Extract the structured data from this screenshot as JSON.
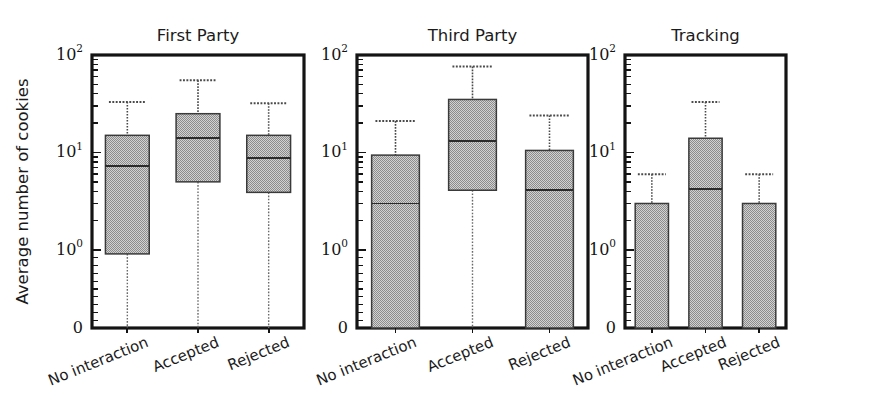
{
  "figure": {
    "ylabel": "Average number of cookies",
    "ytick_labels": [
      "10",
      "10",
      "10",
      "0"
    ],
    "ytick_exponents": [
      "2",
      "1",
      "0",
      ""
    ],
    "categories": [
      "No interaction",
      "Accepted",
      "Rejected"
    ]
  },
  "chart_data": {
    "type": "box",
    "title": "",
    "subtitle": "",
    "xlabel": "",
    "ylabel": "Average number of cookies",
    "yscale": "symlog",
    "ylim": [
      0,
      100
    ],
    "ytick_values": [
      100,
      10,
      1,
      0
    ],
    "ytick_text": [
      "10^2",
      "10^1",
      "10^0",
      "0"
    ],
    "grid": false,
    "legend": null,
    "categories": [
      "No interaction",
      "Accepted",
      "Rejected"
    ],
    "panels": [
      {
        "title": "First Party",
        "boxes": [
          {
            "category": "No interaction",
            "whisker_high": 33.0,
            "q3": 15.0,
            "median": 7.2,
            "q1": 0.95,
            "whisker_low": 0.0
          },
          {
            "category": "Accepted",
            "whisker_high": 55.0,
            "q3": 25.0,
            "median": 14.0,
            "q1": 5.0,
            "whisker_low": 0.0
          },
          {
            "category": "Rejected",
            "whisker_high": 32.0,
            "q3": 15.0,
            "median": 8.7,
            "q1": 3.9,
            "whisker_low": 0.0
          }
        ]
      },
      {
        "title": "Third Party",
        "boxes": [
          {
            "category": "No interaction",
            "whisker_high": 21.0,
            "q3": 9.4,
            "median": 3.0,
            "q1": 0.0,
            "whisker_low": 0.0
          },
          {
            "category": "Accepted",
            "whisker_high": 76.0,
            "q3": 35.0,
            "median": 13.0,
            "q1": 4.1,
            "whisker_low": 0.0
          },
          {
            "category": "Rejected",
            "whisker_high": 24.0,
            "q3": 10.5,
            "median": 4.1,
            "q1": 0.0,
            "whisker_low": 0.0
          }
        ]
      },
      {
        "title": "Tracking",
        "boxes": [
          {
            "category": "No interaction",
            "whisker_high": 6.0,
            "q3": 3.0,
            "median": null,
            "q1": 0.0,
            "whisker_low": 0.0
          },
          {
            "category": "Accepted",
            "whisker_high": 33.0,
            "q3": 14.0,
            "median": 4.2,
            "q1": 0.0,
            "whisker_low": 0.0
          },
          {
            "category": "Rejected",
            "whisker_high": 6.0,
            "q3": 3.0,
            "median": null,
            "q1": 0.0,
            "whisker_low": 0.0
          }
        ]
      }
    ]
  }
}
